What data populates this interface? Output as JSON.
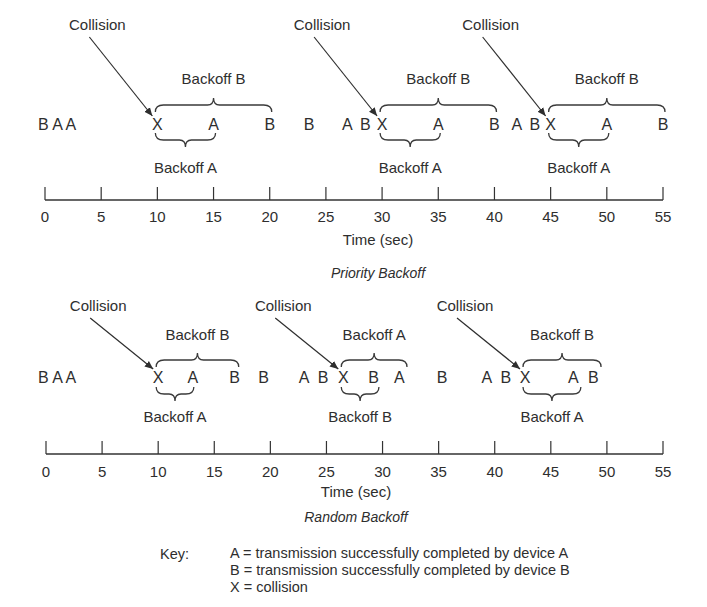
{
  "figure": {
    "panels": [
      {
        "id": "priority",
        "title": "Priority Backoff",
        "axis_label": "Time (sec)",
        "ticks": [
          "0",
          "5",
          "10",
          "15",
          "20",
          "25",
          "30",
          "35",
          "40",
          "45",
          "50",
          "55"
        ],
        "pre_sequence": "B A A",
        "events": [
          {
            "t": 10,
            "label": "X"
          },
          {
            "t": 15,
            "label": "A"
          },
          {
            "t": 20,
            "label": "B"
          },
          {
            "t": 23.5,
            "label": "B"
          },
          {
            "t": 26.9,
            "label": "A"
          },
          {
            "t": 28.5,
            "label": "B"
          },
          {
            "t": 30,
            "label": "X"
          },
          {
            "t": 35,
            "label": "A"
          },
          {
            "t": 40,
            "label": "B"
          },
          {
            "t": 42,
            "label": "A"
          },
          {
            "t": 43.6,
            "label": "B"
          },
          {
            "t": 45,
            "label": "X"
          },
          {
            "t": 50,
            "label": "A"
          },
          {
            "t": 55,
            "label": "B"
          }
        ],
        "collisions": [
          {
            "label": "Collision",
            "t": 10,
            "over": {
              "label": "Backoff B",
              "from": 10,
              "to": 20
            },
            "under": {
              "label": "Backoff A",
              "from": 10,
              "to": 15
            }
          },
          {
            "label": "Collision",
            "t": 30,
            "over": {
              "label": "Backoff B",
              "from": 30,
              "to": 40
            },
            "under": {
              "label": "Backoff A",
              "from": 30,
              "to": 35
            }
          },
          {
            "label": "Collision",
            "t": 45,
            "over": {
              "label": "Backoff B",
              "from": 45,
              "to": 55
            },
            "under": {
              "label": "Backoff A",
              "from": 45,
              "to": 50
            }
          }
        ]
      },
      {
        "id": "random",
        "title": "Random Backoff",
        "axis_label": "Time (sec)",
        "ticks": [
          "0",
          "5",
          "10",
          "15",
          "20",
          "25",
          "30",
          "35",
          "40",
          "45",
          "50",
          "55"
        ],
        "pre_sequence": "B A A",
        "events": [
          {
            "t": 10,
            "label": "X"
          },
          {
            "t": 13.1,
            "label": "A"
          },
          {
            "t": 16.8,
            "label": "B"
          },
          {
            "t": 19.4,
            "label": "B"
          },
          {
            "t": 23,
            "label": "A"
          },
          {
            "t": 24.7,
            "label": "B"
          },
          {
            "t": 26.5,
            "label": "X"
          },
          {
            "t": 29.2,
            "label": "B"
          },
          {
            "t": 31.5,
            "label": "A"
          },
          {
            "t": 35.3,
            "label": "B"
          },
          {
            "t": 39.3,
            "label": "A"
          },
          {
            "t": 41,
            "label": "B"
          },
          {
            "t": 42.7,
            "label": "X"
          },
          {
            "t": 47,
            "label": "A"
          },
          {
            "t": 48.8,
            "label": "B"
          }
        ],
        "collisions": [
          {
            "label": "Collision",
            "t": 10,
            "over": {
              "label": "Backoff B",
              "from": 10,
              "to": 17
            },
            "under": {
              "label": "Backoff A",
              "from": 10,
              "to": 13
            }
          },
          {
            "label": "Collision",
            "t": 26.5,
            "over": {
              "label": "Backoff A",
              "from": 26.5,
              "to": 32
            },
            "under": {
              "label": "Backoff B",
              "from": 26.5,
              "to": 29.5
            }
          },
          {
            "label": "Collision",
            "t": 42.7,
            "over": {
              "label": "Backoff B",
              "from": 42.7,
              "to": 49.3
            },
            "under": {
              "label": "Backoff A",
              "from": 42.7,
              "to": 47.5
            }
          }
        ]
      }
    ],
    "key": {
      "label": "Key:",
      "entries": [
        "A = transmission successfully completed by device A",
        "B = transmission successfully completed by device B",
        "X = collision"
      ]
    }
  }
}
